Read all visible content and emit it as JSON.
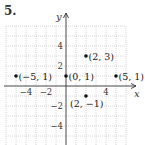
{
  "problem": {
    "number": "5."
  },
  "chart_data": {
    "type": "scatter",
    "title": "",
    "xlabel": "x",
    "ylabel": "y",
    "xlim": [
      -6,
      6
    ],
    "ylim": [
      -6,
      6
    ],
    "grid": true,
    "x_ticks": [
      {
        "value": -4,
        "label": "−4"
      },
      {
        "value": -2,
        "label": "−2"
      },
      {
        "value": 4,
        "label": "4"
      }
    ],
    "y_ticks": [
      {
        "value": 4,
        "label": "4"
      },
      {
        "value": 2,
        "label": "2"
      },
      {
        "value": -2,
        "label": "−2"
      },
      {
        "value": -4,
        "label": "−4"
      }
    ],
    "points": [
      {
        "x": -5,
        "y": 1,
        "label": "(−5, 1)"
      },
      {
        "x": 0,
        "y": 1,
        "label": "(0, 1)"
      },
      {
        "x": 2,
        "y": 3,
        "label": "(2, 3)"
      },
      {
        "x": 5,
        "y": 1,
        "label": "(5, 1)"
      },
      {
        "x": 2,
        "y": -1,
        "label": "(2, −1)"
      }
    ]
  },
  "colors": {
    "grid": "#bdbdbd",
    "axis": "#333333",
    "point": "#111111",
    "text": "#222222"
  }
}
